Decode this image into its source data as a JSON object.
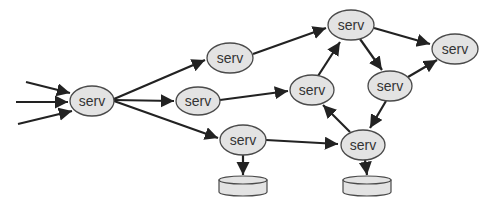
{
  "diagram": {
    "type": "directed-graph",
    "colors": {
      "node_fill": "#e3e3e3",
      "node_stroke": "#4a4a4a",
      "edge": "#222222",
      "text": "#333333"
    },
    "nodes": [
      {
        "id": "n1",
        "label": "serv",
        "cx": 92,
        "cy": 101,
        "rx": 22,
        "ry": 15
      },
      {
        "id": "n2",
        "label": "serv",
        "cx": 230,
        "cy": 58,
        "rx": 23,
        "ry": 15
      },
      {
        "id": "n3",
        "label": "serv",
        "cx": 198,
        "cy": 101,
        "rx": 22,
        "ry": 14
      },
      {
        "id": "n4",
        "label": "serv",
        "cx": 243,
        "cy": 140,
        "rx": 23,
        "ry": 15
      },
      {
        "id": "n5",
        "label": "serv",
        "cx": 351,
        "cy": 25,
        "rx": 23,
        "ry": 15
      },
      {
        "id": "n6",
        "label": "serv",
        "cx": 312,
        "cy": 90,
        "rx": 22,
        "ry": 15
      },
      {
        "id": "n7",
        "label": "serv",
        "cx": 390,
        "cy": 86,
        "rx": 22,
        "ry": 15
      },
      {
        "id": "n8",
        "label": "serv",
        "cx": 455,
        "cy": 49,
        "rx": 23,
        "ry": 15
      },
      {
        "id": "n9",
        "label": "serv",
        "cx": 363,
        "cy": 145,
        "rx": 22,
        "ry": 15
      }
    ],
    "disks": [
      {
        "id": "d1",
        "cx": 243,
        "top": 180,
        "rx": 24,
        "ry": 4,
        "height": 12
      },
      {
        "id": "d2",
        "cx": 367,
        "top": 180,
        "rx": 24,
        "ry": 4,
        "height": 12
      }
    ],
    "edges": [
      {
        "from": "in",
        "to": "n1",
        "x1": 26,
        "y1": 82,
        "x2": 70,
        "y2": 93
      },
      {
        "from": "in",
        "to": "n1",
        "x1": 16,
        "y1": 102,
        "x2": 68,
        "y2": 102
      },
      {
        "from": "in",
        "to": "n1",
        "x1": 18,
        "y1": 124,
        "x2": 72,
        "y2": 111
      },
      {
        "from": "n1",
        "to": "n2",
        "x1": 114,
        "y1": 99,
        "x2": 205,
        "y2": 60
      },
      {
        "from": "n1",
        "to": "n3",
        "x1": 114,
        "y1": 100,
        "x2": 174,
        "y2": 101
      },
      {
        "from": "n1",
        "to": "n4",
        "x1": 114,
        "y1": 101,
        "x2": 218,
        "y2": 138
      },
      {
        "from": "n2",
        "to": "n5",
        "x1": 253,
        "y1": 54,
        "x2": 326,
        "y2": 28
      },
      {
        "from": "n3",
        "to": "n6",
        "x1": 220,
        "y1": 100,
        "x2": 288,
        "y2": 91
      },
      {
        "from": "n6",
        "to": "n5",
        "x1": 318,
        "y1": 76,
        "x2": 340,
        "y2": 42
      },
      {
        "from": "n5",
        "to": "n8",
        "x1": 374,
        "y1": 28,
        "x2": 430,
        "y2": 44
      },
      {
        "from": "n5",
        "to": "n7",
        "x1": 360,
        "y1": 39,
        "x2": 382,
        "y2": 70
      },
      {
        "from": "n7",
        "to": "n8",
        "x1": 408,
        "y1": 77,
        "x2": 437,
        "y2": 60
      },
      {
        "from": "n7",
        "to": "n9",
        "x1": 386,
        "y1": 101,
        "x2": 370,
        "y2": 128
      },
      {
        "from": "n9",
        "to": "n6",
        "x1": 350,
        "y1": 132,
        "x2": 323,
        "y2": 105
      },
      {
        "from": "n4",
        "to": "n9",
        "x1": 266,
        "y1": 140,
        "x2": 338,
        "y2": 144
      },
      {
        "from": "n4",
        "to": "d1",
        "x1": 243,
        "y1": 155,
        "x2": 243,
        "y2": 175
      },
      {
        "from": "n9",
        "to": "d2",
        "x1": 365,
        "y1": 160,
        "x2": 367,
        "y2": 175
      }
    ]
  }
}
